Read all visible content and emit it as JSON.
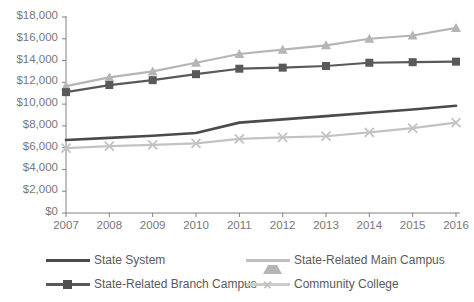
{
  "chart_data": {
    "type": "line",
    "title": "",
    "xlabel": "",
    "ylabel": "",
    "grid": false,
    "legend_position": "bottom",
    "x": [
      "2007",
      "2008",
      "2009",
      "2010",
      "2011",
      "2012",
      "2013",
      "2014",
      "2015",
      "2016"
    ],
    "categories": [
      "2007",
      "2008",
      "2009",
      "2010",
      "2011",
      "2012",
      "2013",
      "2014",
      "2015",
      "2016"
    ],
    "ylim": [
      0,
      18000
    ],
    "yticks": [
      0,
      2000,
      4000,
      6000,
      8000,
      10000,
      12000,
      14000,
      16000,
      18000
    ],
    "ytick_labels": [
      "$0",
      "$2,000",
      "$4,000",
      "$6,000",
      "$8,000",
      "$10,000",
      "$12,000",
      "$14,000",
      "$16,000",
      "$18,000"
    ],
    "series": [
      {
        "name": "State System",
        "marker": "none",
        "color": "#4a4a4a",
        "values": [
          6700,
          6900,
          7100,
          7350,
          8300,
          8600,
          8900,
          9200,
          9500,
          9850
        ]
      },
      {
        "name": "State-Related Main Campus",
        "marker": "triangle",
        "color": "#b5b5b5",
        "values": [
          11650,
          12450,
          13000,
          13800,
          14600,
          15000,
          15400,
          16000,
          16300,
          17000
        ]
      },
      {
        "name": "State-Related Branch Campus",
        "marker": "square",
        "color": "#595959",
        "values": [
          11100,
          11750,
          12200,
          12750,
          13250,
          13350,
          13500,
          13800,
          13850,
          13900
        ]
      },
      {
        "name": "Community College",
        "marker": "x",
        "color": "#c2c2c2",
        "values": [
          5950,
          6150,
          6250,
          6400,
          6800,
          6950,
          7050,
          7400,
          7800,
          8300
        ]
      }
    ]
  },
  "legend": {
    "items": [
      {
        "label": "State System"
      },
      {
        "label": "State-Related Main Campus"
      },
      {
        "label": "State-Related Branch Campus"
      },
      {
        "label": "Community College"
      }
    ]
  },
  "colors": {
    "state_system": "#4a4a4a",
    "main_campus": "#b5b5b5",
    "branch_campus": "#595959",
    "community_college": "#c2c2c2",
    "axis": "#808080",
    "tick_text": "#777777",
    "background": "#ffffff"
  }
}
